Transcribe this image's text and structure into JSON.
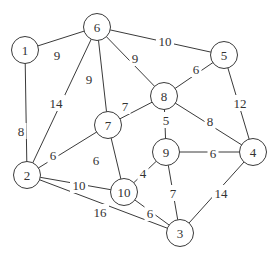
{
  "graph": {
    "node_radius": 13.5,
    "colors": {
      "stroke": "#3a3a3a",
      "text": "#333333",
      "background": "#ffffff"
    },
    "nodes": [
      {
        "id": "1",
        "label": "1",
        "x": 25,
        "y": 50
      },
      {
        "id": "2",
        "label": "2",
        "x": 27,
        "y": 175
      },
      {
        "id": "3",
        "label": "3",
        "x": 180,
        "y": 233
      },
      {
        "id": "4",
        "label": "4",
        "x": 253,
        "y": 152
      },
      {
        "id": "5",
        "label": "5",
        "x": 224,
        "y": 55
      },
      {
        "id": "6",
        "label": "6",
        "x": 97,
        "y": 27
      },
      {
        "id": "7",
        "label": "7",
        "x": 108,
        "y": 125
      },
      {
        "id": "8",
        "label": "8",
        "x": 164,
        "y": 96
      },
      {
        "id": "9",
        "label": "9",
        "x": 166,
        "y": 152
      },
      {
        "id": "10",
        "label": "10",
        "x": 124,
        "y": 192
      }
    ],
    "edges": [
      {
        "from": "1",
        "to": "6",
        "weight": "9",
        "lx": 57,
        "ly": 55
      },
      {
        "from": "1",
        "to": "2",
        "weight": "8",
        "lx": 21,
        "ly": 131
      },
      {
        "from": "6",
        "to": "2",
        "weight": "14",
        "lx": 56,
        "ly": 103
      },
      {
        "from": "6",
        "to": "7",
        "weight": "9",
        "lx": 89,
        "ly": 79
      },
      {
        "from": "6",
        "to": "8",
        "weight": "9",
        "lx": 135,
        "ly": 58
      },
      {
        "from": "6",
        "to": "5",
        "weight": "10",
        "lx": 165,
        "ly": 41
      },
      {
        "from": "5",
        "to": "8",
        "weight": "6",
        "lx": 196,
        "ly": 69
      },
      {
        "from": "5",
        "to": "4",
        "weight": "12",
        "lx": 240,
        "ly": 103
      },
      {
        "from": "8",
        "to": "7",
        "weight": "7",
        "lx": 125,
        "ly": 106
      },
      {
        "from": "8",
        "to": "9",
        "weight": "5",
        "lx": 166,
        "ly": 120
      },
      {
        "from": "8",
        "to": "4",
        "weight": "8",
        "lx": 210,
        "ly": 121
      },
      {
        "from": "7",
        "to": "2",
        "weight": "6",
        "lx": 53,
        "ly": 155
      },
      {
        "from": "7",
        "to": "10",
        "weight": "6",
        "lx": 96,
        "ly": 160
      },
      {
        "from": "9",
        "to": "4",
        "weight": "6",
        "lx": 213,
        "ly": 153
      },
      {
        "from": "9",
        "to": "10",
        "weight": "4",
        "lx": 143,
        "ly": 173
      },
      {
        "from": "9",
        "to": "3",
        "weight": "7",
        "lx": 173,
        "ly": 193
      },
      {
        "from": "4",
        "to": "3",
        "weight": "14",
        "lx": 221,
        "ly": 193
      },
      {
        "from": "2",
        "to": "10",
        "weight": "10",
        "lx": 79,
        "ly": 185
      },
      {
        "from": "2",
        "to": "3",
        "weight": "16",
        "lx": 100,
        "ly": 212
      },
      {
        "from": "10",
        "to": "3",
        "weight": "6",
        "lx": 150,
        "ly": 213
      }
    ]
  }
}
